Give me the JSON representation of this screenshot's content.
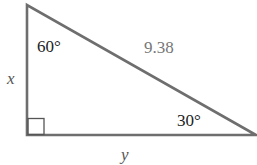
{
  "diagram": {
    "type": "right-triangle",
    "angles": {
      "top": "60°",
      "bottom_right": "30°",
      "bottom_left": "right-angle"
    },
    "sides": {
      "hypotenuse": "9.38",
      "vertical": "x",
      "horizontal": "y"
    },
    "colors": {
      "stroke": "#6e6e6e",
      "text": "#222222",
      "hyp_text": "#777777",
      "var_text": "#555555"
    }
  }
}
